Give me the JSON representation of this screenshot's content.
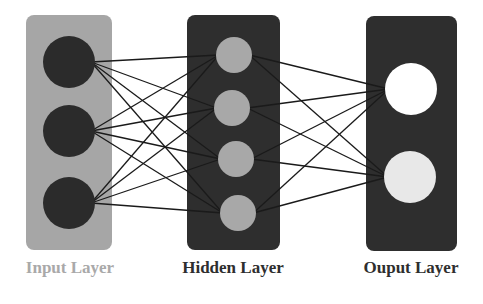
{
  "diagram": {
    "type": "neural-network",
    "layers": [
      {
        "id": "input",
        "label": "Input Layer",
        "label_color": "#a9a9a9",
        "box": {
          "x": 26,
          "y": 15,
          "w": 86,
          "h": 235,
          "fill": "#a6a6a6"
        },
        "node_fill": "#2b2b2b",
        "nodes": [
          {
            "cx": 69,
            "cy": 62,
            "r": 26
          },
          {
            "cx": 69,
            "cy": 131,
            "r": 26
          },
          {
            "cx": 69,
            "cy": 203,
            "r": 26
          }
        ]
      },
      {
        "id": "hidden",
        "label": "Hidden Layer",
        "label_color": "#2e2e2e",
        "box": {
          "x": 187,
          "y": 15,
          "w": 93,
          "h": 235,
          "fill": "#2e2e2e"
        },
        "node_fill": "#a8a8a8",
        "nodes": [
          {
            "cx": 234,
            "cy": 55,
            "r": 18
          },
          {
            "cx": 232,
            "cy": 108,
            "r": 18
          },
          {
            "cx": 236,
            "cy": 159,
            "r": 18
          },
          {
            "cx": 238,
            "cy": 213,
            "r": 18
          }
        ]
      },
      {
        "id": "output",
        "label": "Ouput Layer",
        "label_color": "#2e2e2e",
        "box": {
          "x": 366,
          "y": 16,
          "w": 91,
          "h": 235,
          "fill": "#2e2e2e"
        },
        "node_fills": [
          "#ffffff",
          "#e8e8e8"
        ],
        "nodes": [
          {
            "cx": 411,
            "cy": 89,
            "r": 26
          },
          {
            "cx": 410,
            "cy": 177,
            "r": 26
          }
        ]
      }
    ],
    "edge_color": "#1a1a1a",
    "edges": "fully-connected between adjacent layers"
  }
}
